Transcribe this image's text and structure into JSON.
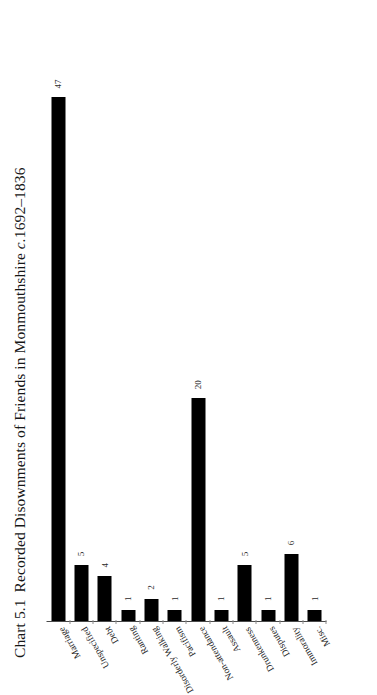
{
  "title": {
    "number": "Chart 5.1",
    "text_main": "Recorded Disownments of Friends in Monmouthshire ",
    "text_italic": "c.",
    "text_tail": "1692–1836",
    "full": "Chart 5.1  Recorded Disownments of Friends in Monmouthshire c.1692–1836"
  },
  "chart_data": {
    "type": "bar",
    "orientation": "horizontal",
    "subtitle": "",
    "xlabel": "",
    "ylabel": "",
    "categories": [
      "Marriage",
      "Unspecified",
      "Debt",
      "Ranting",
      "Disorderly Walking",
      "Pacifism",
      "Non-attendance",
      "Assault",
      "Drunkenness",
      "Disputes",
      "Immorality",
      "Misc."
    ],
    "values": [
      47,
      5,
      4,
      1,
      2,
      1,
      20,
      1,
      5,
      1,
      6,
      1
    ],
    "data_labels": [
      "47",
      "5",
      "4",
      "1",
      "2",
      "1",
      "20",
      "1",
      "5",
      "1",
      "6",
      "1"
    ],
    "xlim": [
      0,
      50
    ],
    "grid": false,
    "legend": false,
    "legend_position": "none",
    "bar_color": "#000000",
    "axis_color": "#4a4a4a"
  },
  "bars": [
    {
      "label": "Marriage",
      "value": 47,
      "value_label": "47"
    },
    {
      "label": "Unspecified",
      "value": 5,
      "value_label": "5"
    },
    {
      "label": "Debt",
      "value": 4,
      "value_label": "4"
    },
    {
      "label": "Ranting",
      "value": 1,
      "value_label": "1"
    },
    {
      "label": "Disorderly Walking",
      "value": 2,
      "value_label": "2"
    },
    {
      "label": "Pacifism",
      "value": 1,
      "value_label": "1"
    },
    {
      "label": "Non-attendance",
      "value": 20,
      "value_label": "20"
    },
    {
      "label": "Assault",
      "value": 1,
      "value_label": "1"
    },
    {
      "label": "Drunkenness",
      "value": 5,
      "value_label": "5"
    },
    {
      "label": "Disputes",
      "value": 1,
      "value_label": "1"
    },
    {
      "label": "Immorality",
      "value": 6,
      "value_label": "6"
    },
    {
      "label": "Misc.",
      "value": 1,
      "value_label": "1"
    }
  ],
  "colors": {
    "bar": "#000000",
    "axis": "#4a4a4a",
    "text": "#1a1a1a",
    "page": "#ffffff"
  }
}
